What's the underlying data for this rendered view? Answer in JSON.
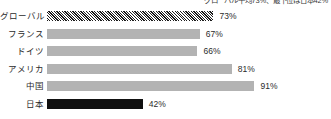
{
  "chart_data": {
    "type": "bar",
    "orientation": "horizontal",
    "title": "",
    "caption": "グローバル平均73%、最下位は日本42%",
    "xlabel": "",
    "ylabel": "",
    "xlim": [
      0,
      100
    ],
    "grid": false,
    "legend": "none",
    "value_suffix": "%",
    "categories": [
      "グローバル",
      "フランス",
      "ドイツ",
      "アメリカ",
      "中国",
      "日本"
    ],
    "values": [
      73,
      67,
      66,
      81,
      91,
      42
    ],
    "value_labels": [
      "73%",
      "67%",
      "66%",
      "81%",
      "91%",
      "42%"
    ],
    "bar_styles": [
      "hatched",
      "solid-gray",
      "solid-gray",
      "solid-gray",
      "solid-gray",
      "solid-dark"
    ]
  },
  "colors": {
    "bar_gray": "#b3b3b3",
    "bar_dark": "#101010",
    "hatch_line": "#1c1c1c",
    "text": "#2b2b2b",
    "background": "#ffffff"
  }
}
